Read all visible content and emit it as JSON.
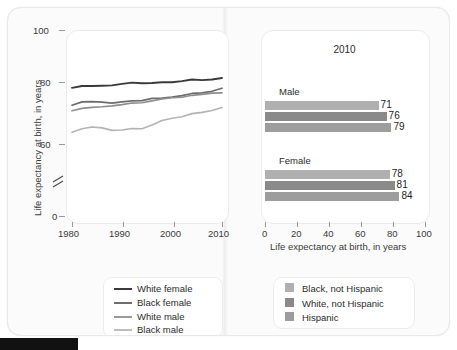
{
  "figure": {
    "background_color": "#fbfbfb",
    "panel_color": "#ffffff"
  },
  "line_chart": {
    "ylabel": "Life expectancy at birth, in years",
    "y_ticks": [
      "100",
      "80",
      "60",
      "0"
    ],
    "axis_break_symbol": "≈",
    "x_ticks": [
      "1980",
      "1990",
      "2000",
      "2010"
    ],
    "xlim": [
      1980,
      2010
    ],
    "ylim": [
      0,
      100
    ],
    "series": [
      {
        "name": "White female",
        "color": "#3a3a3a",
        "width": 1.9
      },
      {
        "name": "Black female",
        "color": "#6d6d6d",
        "width": 1.7
      },
      {
        "name": "White male",
        "color": "#8f8f8f",
        "width": 1.6
      },
      {
        "name": "Black male",
        "color": "#b4b4b4",
        "width": 1.6
      }
    ],
    "legend": {
      "items": [
        {
          "label": "White female",
          "color": "#3a3a3a"
        },
        {
          "label": "Black female",
          "color": "#6d6d6d"
        },
        {
          "label": "White male",
          "color": "#8f8f8f"
        },
        {
          "label": "Black male",
          "color": "#b4b4b4"
        }
      ]
    }
  },
  "bar_chart": {
    "title": "2010",
    "xlabel": "Life expectancy at birth, in years",
    "x_ticks": [
      "0",
      "20",
      "40",
      "60",
      "80",
      "100"
    ],
    "xlim": [
      0,
      100
    ],
    "groups": [
      {
        "label": "Male",
        "bars": [
          {
            "series": "Black, not Hispanic",
            "value": 71,
            "color": "#b0b0b0"
          },
          {
            "series": "White, not Hispanic",
            "value": 76,
            "color": "#8a8a8a"
          },
          {
            "series": "Hispanic",
            "value": 79,
            "color": "#9d9d9d"
          }
        ]
      },
      {
        "label": "Female",
        "bars": [
          {
            "series": "Black, not Hispanic",
            "value": 78,
            "color": "#b0b0b0"
          },
          {
            "series": "White, not Hispanic",
            "value": 81,
            "color": "#8a8a8a"
          },
          {
            "series": "Hispanic",
            "value": 84,
            "color": "#9d9d9d"
          }
        ]
      }
    ],
    "legend": {
      "items": [
        {
          "label": "Black, not Hispanic",
          "color": "#b0b0b0"
        },
        {
          "label": "White, not Hispanic",
          "color": "#8a8a8a"
        },
        {
          "label": "Hispanic",
          "color": "#9d9d9d"
        }
      ]
    }
  },
  "chart_data": [
    {
      "type": "line",
      "title": "",
      "xlabel": "",
      "ylabel": "Life expectancy at birth, in years",
      "xlim": [
        1980,
        2010
      ],
      "ylim": [
        0,
        100
      ],
      "y_ticks": [
        0,
        60,
        80,
        100
      ],
      "x_ticks": [
        1980,
        1990,
        2000,
        2010
      ],
      "grid": false,
      "legend_position": "bottom",
      "axis_break": true,
      "x": [
        1980,
        1982,
        1984,
        1986,
        1988,
        1990,
        1992,
        1994,
        1996,
        1998,
        2000,
        2002,
        2004,
        2006,
        2008,
        2010
      ],
      "series": [
        {
          "name": "White female",
          "values": [
            78.1,
            78.7,
            78.7,
            78.8,
            78.9,
            79.4,
            79.8,
            79.6,
            79.7,
            79.9,
            79.9,
            80.3,
            80.8,
            80.6,
            80.8,
            81.3
          ]
        },
        {
          "name": "Black female",
          "values": [
            72.5,
            73.6,
            73.7,
            73.5,
            73.2,
            73.6,
            73.9,
            74.0,
            74.7,
            74.8,
            75.1,
            75.6,
            76.3,
            76.5,
            77.0,
            78.0
          ]
        },
        {
          "name": "White male",
          "values": [
            70.7,
            71.5,
            71.8,
            72.0,
            72.3,
            72.7,
            73.2,
            73.3,
            73.9,
            74.5,
            74.9,
            75.1,
            75.7,
            76.0,
            76.4,
            76.5
          ]
        },
        {
          "name": "Black male",
          "values": [
            63.8,
            64.9,
            65.5,
            65.2,
            64.4,
            64.5,
            65.0,
            64.9,
            66.1,
            67.6,
            68.3,
            68.8,
            69.8,
            70.2,
            70.8,
            71.8
          ]
        }
      ]
    },
    {
      "type": "bar",
      "orientation": "horizontal",
      "title": "2010",
      "xlabel": "Life expectancy at birth, in years",
      "ylabel": "",
      "xlim": [
        0,
        100
      ],
      "x_ticks": [
        0,
        20,
        40,
        60,
        80,
        100
      ],
      "grid": false,
      "legend_position": "bottom",
      "categories": [
        "Male",
        "Female"
      ],
      "series": [
        {
          "name": "Black, not Hispanic",
          "values": [
            71,
            78
          ]
        },
        {
          "name": "White, not Hispanic",
          "values": [
            76,
            81
          ]
        },
        {
          "name": "Hispanic",
          "values": [
            79,
            84
          ]
        }
      ]
    }
  ]
}
